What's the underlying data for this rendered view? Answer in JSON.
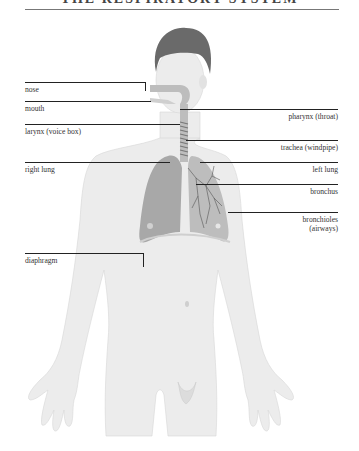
{
  "diagram": {
    "title": "THE RESPIRATORY SYSTEM",
    "colors": {
      "skin": "#ececec",
      "hair": "#6a6a6a",
      "airway": "#bdbdbd",
      "lung": "#a8a8a8",
      "leader_line": "#222222",
      "text": "#333333"
    },
    "labels_left": [
      {
        "id": "nose",
        "text": "nose"
      },
      {
        "id": "mouth",
        "text": "mouth"
      },
      {
        "id": "larynx",
        "text": "larynx (voice box)"
      },
      {
        "id": "right-lung",
        "text": "right lung"
      },
      {
        "id": "diaphragm",
        "text": "diaphragm"
      }
    ],
    "labels_right": [
      {
        "id": "pharynx",
        "text": "pharynx (throat)"
      },
      {
        "id": "trachea",
        "text": "trachea (windpipe)"
      },
      {
        "id": "left-lung",
        "text": "left lung"
      },
      {
        "id": "bronchus",
        "text": "bronchus"
      },
      {
        "id": "bronchioles-1",
        "text": "bronchioles"
      },
      {
        "id": "bronchioles-2",
        "text": "(airways)"
      }
    ]
  }
}
